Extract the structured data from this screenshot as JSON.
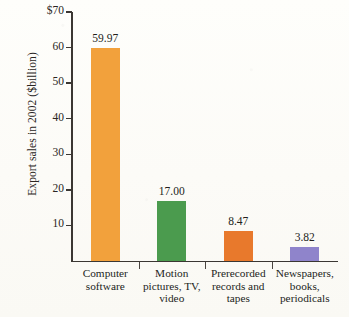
{
  "chart_data": {
    "type": "bar",
    "title": "",
    "xlabel": "",
    "ylabel": "Export sales in 2002 ($billion)",
    "ylim": [
      0,
      70
    ],
    "grid": false,
    "legend": "none",
    "categories": [
      "Computer software",
      "Motion pictures, TV, video",
      "Prerecorded records and tapes",
      "Newspapers, books, periodicals"
    ],
    "values": [
      59.97,
      17.0,
      8.47,
      3.82
    ],
    "data_labels": [
      "59.97",
      "17.00",
      "8.47",
      "3.82"
    ],
    "bar_colors": [
      "#F2A13C",
      "#4B9B4E",
      "#E8792C",
      "#8F84CB"
    ],
    "y_ticks": [
      {
        "value": 70,
        "label": "$70"
      },
      {
        "value": 60,
        "label": "60"
      },
      {
        "value": 50,
        "label": "50"
      },
      {
        "value": 40,
        "label": "40"
      },
      {
        "value": 30,
        "label": "30"
      },
      {
        "value": 20,
        "label": "20"
      },
      {
        "value": 10,
        "label": "10"
      }
    ],
    "category_label_lines": [
      [
        "Computer",
        "software"
      ],
      [
        "Motion",
        "pictures, TV,",
        "video"
      ],
      [
        "Prerecorded",
        "records and",
        "tapes"
      ],
      [
        "Newspapers,",
        "books,",
        "periodicals"
      ]
    ],
    "axis_color": "#3b3733",
    "background_color": "#fdfdfa"
  }
}
